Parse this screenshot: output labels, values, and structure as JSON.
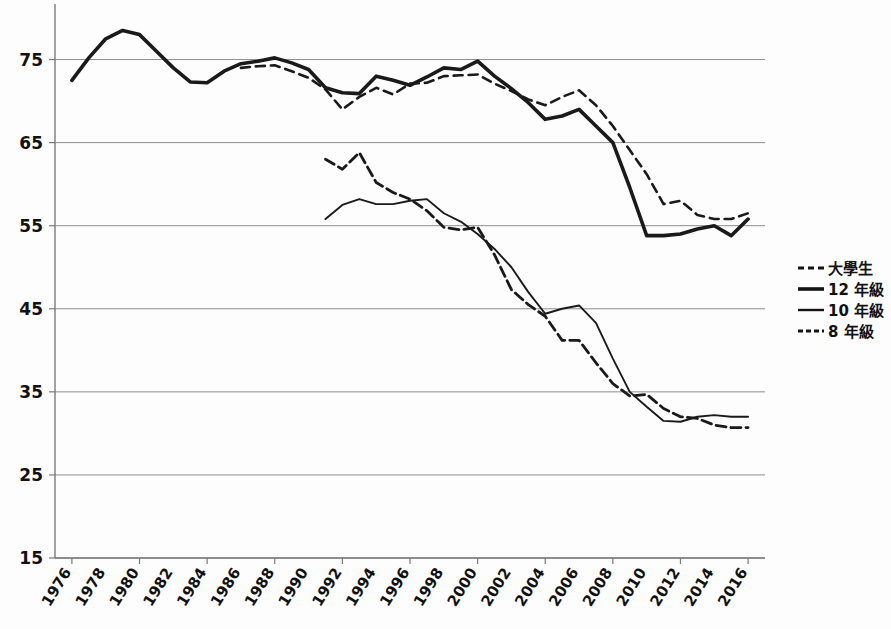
{
  "chart_data": {
    "type": "line",
    "title": "",
    "subtitle": "",
    "xlabel": "",
    "ylabel": "",
    "xlim": [
      1975,
      2017
    ],
    "ylim": [
      15,
      80
    ],
    "yticks": [
      15,
      25,
      35,
      45,
      55,
      65,
      75
    ],
    "ytick_labels": [
      "15",
      "25",
      "35",
      "45",
      "55",
      "65",
      "75"
    ],
    "xticks": [
      1976,
      1978,
      1980,
      1982,
      1984,
      1986,
      1988,
      1990,
      1992,
      1994,
      1996,
      1998,
      2000,
      2002,
      2004,
      2006,
      2008,
      2010,
      2012,
      2014,
      2016
    ],
    "xtick_labels": [
      "1976",
      "1978",
      "1980",
      "1982",
      "1984",
      "1986",
      "1988",
      "1990",
      "1992",
      "1994",
      "1996",
      "1998",
      "2000",
      "2002",
      "2004",
      "2006",
      "2008",
      "2010",
      "2012",
      "2014",
      "2016"
    ],
    "grid": "horizontal",
    "legend_position": "right",
    "series": [
      {
        "name": "大學生",
        "style": "dashed",
        "stroke_width": 2.6,
        "dash": "9,6",
        "color": "#333333",
        "x": [
          1986,
          1987,
          1988,
          1989,
          1990,
          1991,
          1992,
          1993,
          1994,
          1995,
          1996,
          1997,
          1998,
          1999,
          2000,
          2001,
          2002,
          2003,
          2004,
          2005,
          2006,
          2007,
          2008,
          2009,
          2010,
          2011,
          2012,
          2013,
          2014,
          2015,
          2016
        ],
        "y": [
          74.0,
          74.2,
          74.3,
          73.6,
          72.8,
          71.4,
          69.0,
          70.5,
          71.6,
          70.8,
          72.1,
          72.2,
          73.0,
          73.1,
          73.2,
          72.1,
          71.2,
          70.2,
          69.5,
          70.5,
          71.3,
          69.5,
          67.0,
          64.1,
          61.2,
          57.6,
          58.0,
          56.3,
          55.8,
          55.8,
          56.5
        ]
      },
      {
        "name": "12 年級",
        "style": "solid",
        "stroke_width": 3.6,
        "dash": "",
        "color": "#141414",
        "x": [
          1976,
          1977,
          1978,
          1979,
          1980,
          1981,
          1982,
          1983,
          1984,
          1985,
          1986,
          1987,
          1988,
          1989,
          1990,
          1991,
          1992,
          1993,
          1994,
          1995,
          1996,
          1997,
          1998,
          1999,
          2000,
          2001,
          2002,
          2003,
          2004,
          2005,
          2006,
          2007,
          2008,
          2009,
          2010,
          2011,
          2012,
          2013,
          2014,
          2015,
          2016
        ],
        "y": [
          72.5,
          75.2,
          77.5,
          78.5,
          78.0,
          76.0,
          74.0,
          72.3,
          72.2,
          73.6,
          74.5,
          74.8,
          75.2,
          74.6,
          73.8,
          71.6,
          71.0,
          70.9,
          73.0,
          72.5,
          71.9,
          72.9,
          74.0,
          73.8,
          74.8,
          73.0,
          71.5,
          69.8,
          67.8,
          68.2,
          69.0,
          67.0,
          65.0,
          59.6,
          53.8,
          53.8,
          54.0,
          54.6,
          55.0,
          53.8,
          55.8
        ]
      },
      {
        "name": "10 年級",
        "style": "solid-thin",
        "stroke_width": 1.9,
        "dash": "",
        "color": "#3a3a3a",
        "x": [
          1991,
          1992,
          1993,
          1994,
          1995,
          1996,
          1997,
          1998,
          1999,
          2000,
          2001,
          2002,
          2003,
          2004,
          2005,
          2006,
          2007,
          2008,
          2009,
          2010,
          2011,
          2012,
          2013,
          2014,
          2015,
          2016
        ],
        "y": [
          55.8,
          57.5,
          58.2,
          57.6,
          57.6,
          58.0,
          58.2,
          56.5,
          55.5,
          54.0,
          52.2,
          50.0,
          47.0,
          44.4,
          45.0,
          45.4,
          43.3,
          39.0,
          35.0,
          33.2,
          31.5,
          31.4,
          32.0,
          32.2,
          32.0,
          32.0
        ]
      },
      {
        "name": "8 年級",
        "style": "dashed-heavy",
        "stroke_width": 2.8,
        "dash": "10,5",
        "color": "#111111",
        "x": [
          1991,
          1992,
          1993,
          1994,
          1995,
          1996,
          1997,
          1998,
          1999,
          2000,
          2001,
          2002,
          2003,
          2004,
          2005,
          2006,
          2007,
          2008,
          2009,
          2010,
          2011,
          2012,
          2013,
          2014,
          2015,
          2016
        ],
        "y": [
          63.0,
          61.8,
          63.8,
          60.2,
          59.0,
          58.2,
          56.8,
          54.8,
          54.5,
          54.8,
          51.5,
          47.3,
          45.5,
          44.1,
          41.2,
          41.2,
          38.5,
          36.0,
          34.5,
          34.7,
          33.0,
          32.0,
          31.8,
          31.0,
          30.7,
          30.7
        ]
      }
    ]
  },
  "legend": {
    "items": [
      {
        "label": "大學生",
        "marker": "dashed"
      },
      {
        "label": "12 年級",
        "marker": "solid-thick"
      },
      {
        "label": "10 年級",
        "marker": "solid-thin"
      },
      {
        "label": "8 年級",
        "marker": "dotted"
      }
    ]
  },
  "caption": {
    "text": ""
  }
}
